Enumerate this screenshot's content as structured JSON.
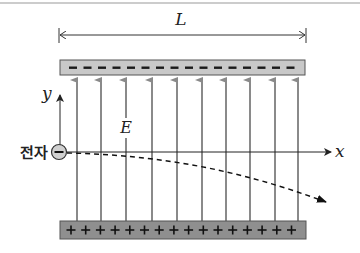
{
  "diagram": {
    "length_label": "L",
    "field_label": "E",
    "axis_x_label": "x",
    "axis_y_label": "y",
    "particle_label": "전자",
    "particle_symbol": "−",
    "top_plate": {
      "charge": "negative",
      "symbol": "−",
      "count": 16,
      "color": "#c8c8c8"
    },
    "bottom_plate": {
      "charge": "positive",
      "symbol": "+",
      "count": 16,
      "color": "#8f8f8f"
    },
    "field_lines": {
      "count": 10,
      "direction": "up",
      "color": "#8a8a8a",
      "x_positions": [
        77,
        101,
        126,
        152,
        177,
        202,
        226,
        250,
        275,
        298
      ]
    },
    "trajectory": {
      "style": "dashed",
      "color": "#111111"
    },
    "colors": {
      "line": "#333333",
      "plate_border": "#555555",
      "field": "#8a8a8a"
    }
  }
}
